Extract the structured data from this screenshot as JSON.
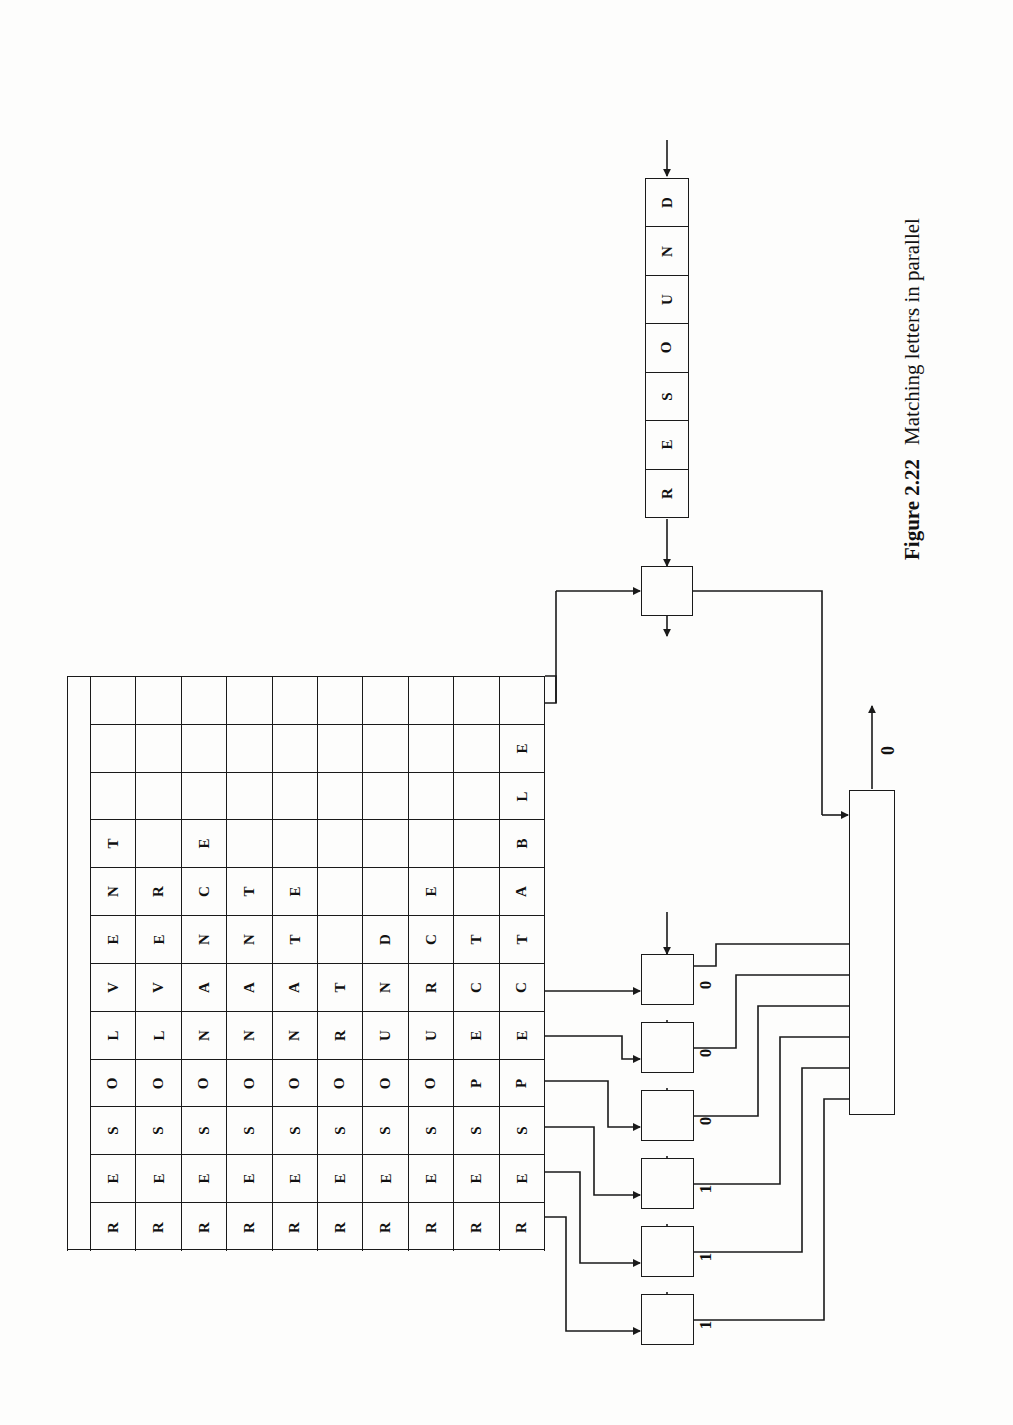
{
  "figure": {
    "number": "Figure 2.22",
    "caption": "Matching letters in parallel",
    "orientation": "rotated-90-ccw"
  },
  "register": {
    "name": "input-word-register",
    "word": "RESOUND",
    "letters": [
      "D",
      "N",
      "U",
      "O",
      "S",
      "E",
      "R"
    ],
    "input_arrow_label": "",
    "output_arrow_label": ""
  },
  "dictionary": {
    "rows": 12,
    "columns": 11,
    "letter_rows": 11,
    "word_count": 10,
    "words": [
      "RESOLVENT",
      "RESOLVER",
      "RESONANCE",
      "RESONANT",
      "RESONATE",
      "RESORT",
      "RESOUND",
      "RESOURCE",
      "RESPECT",
      "RESPECTABLE"
    ],
    "grid_letters": [
      [
        "",
        "",
        "",
        "",
        "",
        "",
        "",
        "",
        "",
        ""
      ],
      [
        "",
        "",
        "",
        "",
        "",
        "",
        "",
        "",
        "",
        "E"
      ],
      [
        "",
        "",
        "",
        "",
        "",
        "",
        "",
        "",
        "",
        "L"
      ],
      [
        "T",
        "",
        "E",
        "",
        "",
        "",
        "",
        "",
        "",
        "B"
      ],
      [
        "N",
        "R",
        "C",
        "T",
        "E",
        "",
        "",
        "E",
        "",
        "A"
      ],
      [
        "E",
        "E",
        "N",
        "N",
        "T",
        "",
        "D",
        "C",
        "T",
        "T"
      ],
      [
        "V",
        "V",
        "A",
        "A",
        "A",
        "T",
        "N",
        "R",
        "C",
        "C"
      ],
      [
        "L",
        "L",
        "N",
        "N",
        "N",
        "R",
        "U",
        "U",
        "E",
        "E"
      ],
      [
        "O",
        "O",
        "O",
        "O",
        "O",
        "O",
        "O",
        "O",
        "P",
        "P"
      ],
      [
        "S",
        "S",
        "S",
        "S",
        "S",
        "S",
        "S",
        "S",
        "S",
        "S"
      ],
      [
        "E",
        "E",
        "E",
        "E",
        "E",
        "E",
        "E",
        "E",
        "E",
        "E"
      ],
      [
        "R",
        "R",
        "R",
        "R",
        "R",
        "R",
        "R",
        "R",
        "R",
        "R"
      ]
    ]
  },
  "comparators": {
    "count": 6,
    "boxes": [
      {
        "id": "comparator-1",
        "bit": "0"
      },
      {
        "id": "comparator-2",
        "bit": "0"
      },
      {
        "id": "comparator-3",
        "bit": "0"
      },
      {
        "id": "comparator-4",
        "bit": "1"
      },
      {
        "id": "comparator-5",
        "bit": "1"
      },
      {
        "id": "comparator-6",
        "bit": "1"
      }
    ]
  },
  "control_box": {
    "name": "control-unit",
    "label": ""
  },
  "match_box": {
    "name": "match-collector",
    "label": "",
    "output_bit": "0",
    "input_count": 6
  },
  "colors": {
    "ink": "#1a1a1a",
    "paper": "#fdfdfc"
  }
}
